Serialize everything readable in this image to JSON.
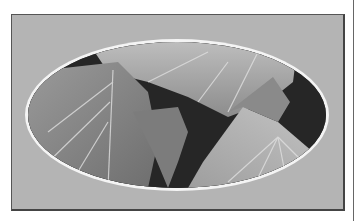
{
  "image": {
    "subject": "ivy-leaves-closeup",
    "style": "grayscale photo in oval vignette",
    "colors": {
      "page_background": "#ffffff",
      "mat": "#b4b4b4",
      "frame_border": "#555555",
      "oval_ring": "#f4f4f4"
    }
  }
}
